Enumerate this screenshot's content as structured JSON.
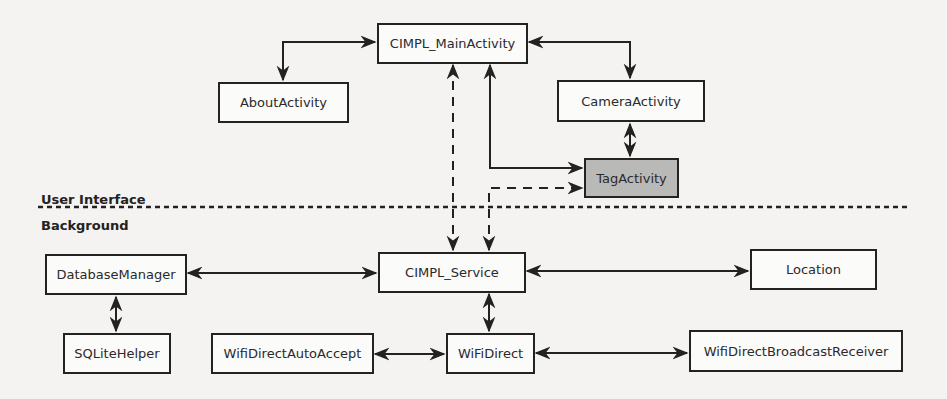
{
  "layers": {
    "top": "User Interface",
    "bottom": "Background"
  },
  "nodes": {
    "main_activity": "CIMPL_MainActivity",
    "about_activity": "AboutActivity",
    "camera_activity": "CameraActivity",
    "tag_activity": "TagActivity",
    "service": "CIMPL_Service",
    "database_manager": "DatabaseManager",
    "location": "Location",
    "sqlite_helper": "SQLiteHelper",
    "wifi_direct_auto_accept": "WifiDirectAutoAccept",
    "wifi_direct": "WiFiDirect",
    "wifi_direct_broadcast_receiver": "WifiDirectBroadcastReceiver"
  },
  "edges": [
    {
      "from": "CIMPL_MainActivity",
      "to": "AboutActivity",
      "style": "solid",
      "direction": "both"
    },
    {
      "from": "CIMPL_MainActivity",
      "to": "CameraActivity",
      "style": "solid",
      "direction": "both"
    },
    {
      "from": "CameraActivity",
      "to": "TagActivity",
      "style": "solid",
      "direction": "both"
    },
    {
      "from": "CIMPL_MainActivity",
      "to": "TagActivity",
      "style": "solid",
      "direction": "both"
    },
    {
      "from": "CIMPL_Service",
      "to": "CIMPL_MainActivity",
      "style": "dashed",
      "direction": "both"
    },
    {
      "from": "CIMPL_Service",
      "to": "TagActivity",
      "style": "dashed",
      "direction": "both"
    },
    {
      "from": "CIMPL_Service",
      "to": "DatabaseManager",
      "style": "solid",
      "direction": "both"
    },
    {
      "from": "CIMPL_Service",
      "to": "Location",
      "style": "solid",
      "direction": "both"
    },
    {
      "from": "CIMPL_Service",
      "to": "WiFiDirect",
      "style": "solid",
      "direction": "both"
    },
    {
      "from": "DatabaseManager",
      "to": "SQLiteHelper",
      "style": "solid",
      "direction": "both"
    },
    {
      "from": "WifiDirectAutoAccept",
      "to": "WiFiDirect",
      "style": "solid",
      "direction": "both"
    },
    {
      "from": "WiFiDirect",
      "to": "WifiDirectBroadcastReceiver",
      "style": "solid",
      "direction": "both"
    }
  ],
  "colors": {
    "highlight_fill": "#b9b9b7",
    "stroke": "#222222"
  }
}
